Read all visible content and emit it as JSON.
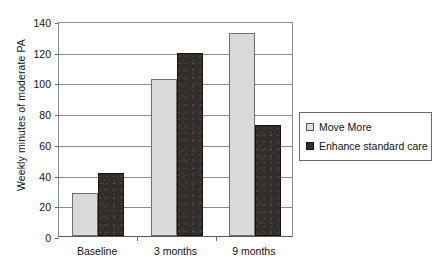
{
  "chart_data": {
    "type": "bar",
    "title": "",
    "xlabel": "",
    "ylabel": "Weekly minutes of moderate PA",
    "categories": [
      "Baseline",
      "3 months",
      "9 months"
    ],
    "yticks": [
      0,
      20,
      40,
      60,
      80,
      100,
      120,
      140
    ],
    "ylim": [
      0,
      140
    ],
    "grid": true,
    "legend_position": "right",
    "series": [
      {
        "name": "Move More",
        "color": "#d9d9d9",
        "values": [
          28,
          102,
          132
        ]
      },
      {
        "name": "Enhance standard care",
        "color": "#332e2c",
        "values": [
          41,
          119,
          72
        ]
      }
    ]
  },
  "colors": {
    "axis": "#8c8c8c",
    "grid": "#8c8c8c",
    "text": "#111111",
    "background": "#ffffff",
    "series_light": "#d9d9d9",
    "series_dark": "#332e2c"
  }
}
